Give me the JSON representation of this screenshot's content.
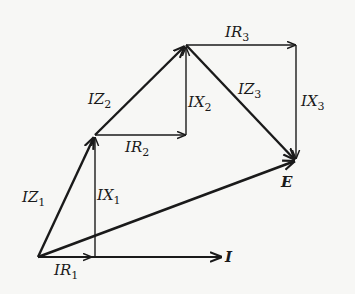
{
  "diagram": {
    "type": "phasor-diagram",
    "colors": {
      "ink": "#1a1a1a",
      "background": "#f7f7f5"
    },
    "points": {
      "O": [
        38,
        257
      ],
      "A": [
        95,
        135
      ],
      "B": [
        186,
        45
      ],
      "E": [
        296,
        161
      ],
      "R1": [
        95,
        257
      ],
      "R2": [
        186,
        135
      ],
      "R3": [
        296,
        45
      ],
      "I_tip": [
        222,
        257
      ]
    },
    "labels": {
      "IZ1": {
        "base": "IZ",
        "sub": "1"
      },
      "IX1": {
        "base": "IX",
        "sub": "1"
      },
      "IR1": {
        "base": "IR",
        "sub": "1"
      },
      "IZ2": {
        "base": "IZ",
        "sub": "2"
      },
      "IX2": {
        "base": "IX",
        "sub": "2"
      },
      "IR2": {
        "base": "IR",
        "sub": "2"
      },
      "IZ3": {
        "base": "IZ",
        "sub": "3"
      },
      "IX3": {
        "base": "IX",
        "sub": "3"
      },
      "IR3": {
        "base": "IR",
        "sub": "3"
      },
      "E": "E",
      "I": "I"
    }
  }
}
